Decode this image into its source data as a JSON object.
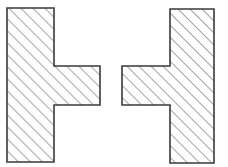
{
  "diagram": {
    "stroke_color": "#3a3a3a",
    "hatch_color": "#4a4a4a",
    "background": "#ffffff",
    "hatch_spacing": 8.5,
    "shapes": [
      {
        "name": "left-t-section",
        "points": "7,8 54,8 54,66 100,66 100,105 54,105 54,162 7,162"
      },
      {
        "name": "right-t-section",
        "points": "170,9 214,9 214,163 170,163 170,105 122,105 122,66 170,66"
      }
    ]
  }
}
